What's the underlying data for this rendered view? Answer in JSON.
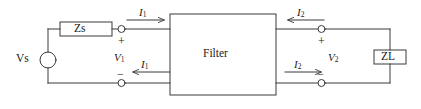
{
  "figure": {
    "type": "circuit-schematic",
    "width": 421,
    "height": 109,
    "line_color": "#3a3a3a",
    "text_color": "#1a1a1a",
    "background": "#ffffff"
  },
  "components": {
    "source_label": "Vs",
    "source_impedance_label": "Zs",
    "block_label": "Filter",
    "load_impedance_label": "ZL"
  },
  "port1": {
    "voltage_label": "V",
    "voltage_sub": "1",
    "plus_sign": "+",
    "minus_sign": "−",
    "current_top_label": "I",
    "current_top_sub": "1",
    "current_bottom_label": "I",
    "current_bottom_sub": "1",
    "current_top_direction": "right",
    "current_bottom_direction": "left"
  },
  "port2": {
    "voltage_label": "V",
    "voltage_sub": "2",
    "plus_sign": "+",
    "minus_sign": "−",
    "current_top_label": "I",
    "current_top_sub": "2",
    "current_bottom_label": "I",
    "current_bottom_sub": "2",
    "current_top_direction": "left",
    "current_bottom_direction": "right"
  }
}
